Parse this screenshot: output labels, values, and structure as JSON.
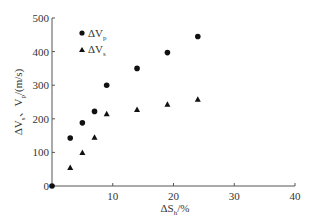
{
  "chart_data": {
    "type": "scatter",
    "title": "",
    "xlabel": "ΔS_h/%",
    "ylabel": "ΔV_s、V_p/(m/s)",
    "xlim": [
      0,
      40
    ],
    "ylim": [
      0,
      500
    ],
    "xticks": [
      10,
      20,
      30,
      40
    ],
    "yticks": [
      0,
      100,
      200,
      300,
      400,
      500
    ],
    "grid": false,
    "legend_position": "upper-left-inside",
    "series": [
      {
        "name": "ΔV_p",
        "marker": "circle",
        "x": [
          0,
          3,
          5,
          7,
          9,
          14,
          19,
          24
        ],
        "y": [
          0,
          143,
          188,
          222,
          300,
          350,
          397,
          445
        ]
      },
      {
        "name": "ΔV_s",
        "marker": "triangle",
        "x": [
          3,
          5,
          7,
          9,
          14,
          19,
          24
        ],
        "y": [
          55,
          100,
          145,
          215,
          228,
          243,
          258
        ]
      }
    ]
  },
  "axes": {
    "x_label_main": "ΔS",
    "x_label_sub": "h",
    "x_label_unit": "/%",
    "y_label_part1": "ΔV",
    "y_label_sub1": "s",
    "y_label_mid": "、V",
    "y_label_sub2": "p",
    "y_label_unit": "/(m/s)"
  },
  "legend": {
    "vp_main": "ΔV",
    "vp_sub": "p",
    "vs_main": "ΔV",
    "vs_sub": "s"
  }
}
